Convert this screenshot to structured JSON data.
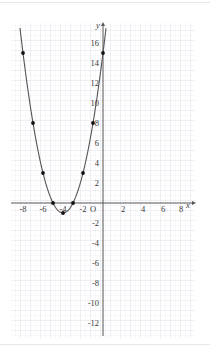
{
  "figure": {
    "axis_labels": {
      "x": "x",
      "y": "y",
      "origin": "O"
    },
    "x_ticks": [
      "-8",
      "-6",
      "-4",
      "-2",
      "2",
      "4",
      "6",
      "8"
    ],
    "y_ticks_positive": [
      "2",
      "4",
      "6",
      "8",
      "10",
      "12",
      "14",
      "16"
    ],
    "y_ticks_negative": [
      "-2",
      "-4",
      "-6",
      "-8",
      "-10",
      "-12"
    ],
    "colors": {
      "grid_minor": "#e9e9ef",
      "grid_major": "#dcdce6",
      "axis": "#555555",
      "curve": "#555555",
      "point": "#111111",
      "page_rule": "#e8e8ea"
    }
  },
  "chart_data": {
    "type": "line",
    "title": "",
    "xlabel": "x",
    "ylabel": "y",
    "grid": true,
    "legend": "none",
    "xlim": [
      -9.2,
      9.2
    ],
    "ylim": [
      -13,
      17.5
    ],
    "x_ticks": [
      -8,
      -6,
      -4,
      -2,
      2,
      4,
      6,
      8
    ],
    "y_ticks": [
      -12,
      -10,
      -8,
      -6,
      -4,
      -2,
      2,
      4,
      6,
      8,
      10,
      12,
      14,
      16
    ],
    "annotations": [
      "Parabola y = (x + 4)^2 - 1, vertex at (-4, -1)"
    ],
    "series": [
      {
        "name": "y = (x + 4)^2 - 1",
        "marked_points": [
          {
            "x": -8,
            "y": 15
          },
          {
            "x": -7,
            "y": 8
          },
          {
            "x": -6,
            "y": 3
          },
          {
            "x": -5,
            "y": 0
          },
          {
            "x": -4,
            "y": -1
          },
          {
            "x": -3,
            "y": 0
          },
          {
            "x": -2,
            "y": 3
          },
          {
            "x": -1,
            "y": 8
          },
          {
            "x": 0,
            "y": 15
          }
        ],
        "vertex": {
          "x": -4,
          "y": -1
        },
        "roots": [
          -5,
          -3
        ]
      }
    ]
  }
}
